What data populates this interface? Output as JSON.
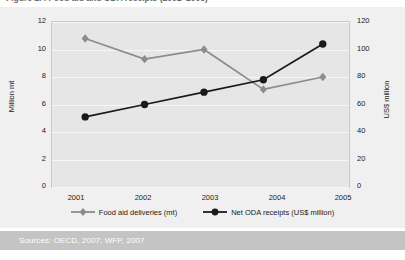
{
  "figure": {
    "title_cutoff": "Figure 1.4  Food aid and ODA receipts (2001–2005)",
    "sources": "Sources: OECD, 2007; WFP, 2007"
  },
  "chart_data": {
    "type": "line",
    "title": "",
    "xlabel": "",
    "categories": [
      "2001",
      "2002",
      "2003",
      "2004",
      "2005"
    ],
    "x_tick_labels": [
      "2001",
      "2002",
      "2003",
      "2004",
      "2005"
    ],
    "grid": true,
    "legend_position": "bottom",
    "axes": {
      "left": {
        "label": "Million mt",
        "ticks": [
          0,
          2,
          4,
          6,
          8,
          10,
          12
        ],
        "tick_labels": [
          "0",
          "2",
          "4",
          "6",
          "8",
          "10",
          "12"
        ],
        "ylim": [
          0,
          12
        ]
      },
      "right": {
        "label": "US$ million",
        "ticks": [
          0,
          20,
          40,
          60,
          80,
          100,
          120
        ],
        "tick_labels": [
          "0",
          "20",
          "40",
          "60",
          "80",
          "100",
          "120"
        ],
        "ylim": [
          0,
          120
        ]
      }
    },
    "series": [
      {
        "name": "Food aid deliveries (mt)",
        "axis": "left",
        "marker": "diamond",
        "color": "#8c8c8c",
        "values": [
          10.8,
          9.3,
          10.0,
          7.1,
          8.0
        ]
      },
      {
        "name": "Net ODA receipts (US$ million)",
        "axis": "right",
        "marker": "circle",
        "color": "#1a1a1a",
        "values": [
          51,
          60,
          69,
          78,
          104
        ]
      }
    ]
  },
  "legend": {
    "items": [
      {
        "label": "Food aid deliveries (mt)",
        "marker": "diamond",
        "color": "#8c8c8c"
      },
      {
        "label": "Net ODA receipts (US$ million)",
        "marker": "circle",
        "color": "#1a1a1a"
      }
    ]
  },
  "colors": {
    "panel_background": "#f0f0f0",
    "plot_background": "#e6e6e6",
    "gridline": "#f7f7f7",
    "series_food_aid": "#8c8c8c",
    "series_oda": "#1a1a1a",
    "sources_band": "#c4c4c4",
    "sources_text": "#ffffff"
  }
}
